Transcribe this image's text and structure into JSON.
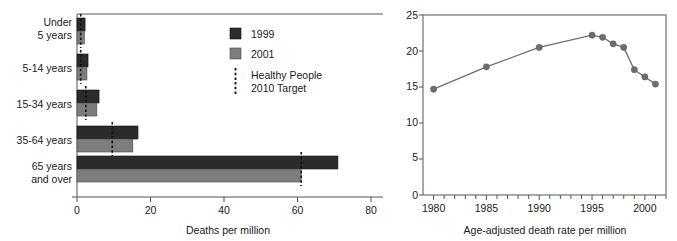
{
  "figure": {
    "title": "",
    "panels": [
      "bar",
      "line"
    ]
  },
  "colors": {
    "series_1999": "#2b2b2b",
    "series_2001": "#7d7d7d",
    "target_line": "#111111",
    "line_series": "#6e6e6e",
    "axis": "#555555"
  },
  "bar_panel": {
    "legend": {
      "items": [
        {
          "label": "1999",
          "swatch": "series_1999"
        },
        {
          "label": "2001",
          "swatch": "series_2001"
        }
      ],
      "target_label_line1": "Healthy People",
      "target_label_line2": "2010 Target"
    },
    "categories_wrapped": [
      [
        "Under",
        "5 years"
      ],
      [
        "5-14 years"
      ],
      [
        "15-34 years"
      ],
      [
        "35-64 years"
      ],
      [
        "65 years",
        "and over"
      ]
    ],
    "xlabel": "Deaths per million",
    "xticks": [
      "0",
      "20",
      "40",
      "60",
      "80"
    ]
  },
  "line_panel": {
    "xlabel": "Age-adjusted death rate per million",
    "xticks": [
      "1980",
      "1985",
      "1990",
      "1995",
      "2000"
    ],
    "yticks": [
      "0",
      "5",
      "10",
      "15",
      "20",
      "25"
    ]
  },
  "chart_data": [
    {
      "type": "bar",
      "orientation": "horizontal",
      "title": "",
      "xlabel": "Deaths per million",
      "ylabel": "",
      "xlim": [
        0,
        80
      ],
      "xticks": [
        0,
        20,
        40,
        60,
        80
      ],
      "grid": false,
      "legend": [
        "1999",
        "2001",
        "Healthy People 2010 Target"
      ],
      "legend_position": "inside-upper-right",
      "categories": [
        "Under 5 years",
        "5-14 years",
        "15-34 years",
        "35-64 years",
        "65 years and over"
      ],
      "series": [
        {
          "name": "1999",
          "values": [
            2.2,
            3.0,
            6.0,
            16.6,
            71.0
          ]
        },
        {
          "name": "2001",
          "values": [
            2.0,
            2.7,
            5.4,
            15.2,
            61.0
          ]
        }
      ],
      "target_markers": {
        "name": "Healthy People 2010 Target",
        "values": [
          1.0,
          1.0,
          2.4,
          9.6,
          61.0
        ]
      }
    },
    {
      "type": "line",
      "title": "",
      "xlabel": "Age-adjusted death rate per million",
      "ylabel": "",
      "xlim": [
        1979,
        2002
      ],
      "ylim": [
        0,
        25
      ],
      "xticks": [
        1980,
        1985,
        1990,
        1995,
        2000
      ],
      "yticks": [
        0,
        5,
        10,
        15,
        20,
        25
      ],
      "grid": false,
      "markers": true,
      "x": [
        1980,
        1985,
        1990,
        1995,
        1996,
        1997,
        1998,
        1999,
        2000,
        2001
      ],
      "values": [
        14.7,
        17.8,
        20.5,
        22.2,
        21.9,
        21.0,
        20.5,
        17.4,
        16.4,
        15.4
      ]
    }
  ]
}
